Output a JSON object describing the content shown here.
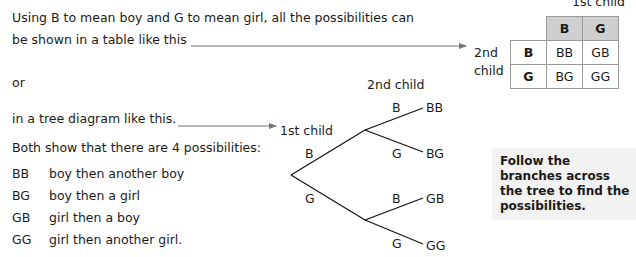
{
  "intro": {
    "line1": "Using B to mean boy and G to mean girl, all the possibilities can",
    "line2": "be shown in a table like this",
    "or": "or",
    "tree_intro": "in a tree diagram like this.",
    "summary": "Both show that there are 4 possibilities:"
  },
  "possibilities": [
    {
      "code": "BB",
      "meaning": "boy then another boy"
    },
    {
      "code": "BG",
      "meaning": "boy then a girl"
    },
    {
      "code": "GB",
      "meaning": "girl then a boy"
    },
    {
      "code": "GG",
      "meaning": "girl then another girl."
    }
  ],
  "table": {
    "col_axis_label": "1st child",
    "row_axis_label": "2nd child",
    "col_headers": [
      "B",
      "G"
    ],
    "rows": [
      {
        "header": "B",
        "cells": [
          "BB",
          "GB"
        ]
      },
      {
        "header": "G",
        "cells": [
          "BG",
          "GG"
        ]
      }
    ],
    "header_fill": "#cfcfcf"
  },
  "tree": {
    "first_level_label": "1st child",
    "second_level_label": "2nd child",
    "first_branches": [
      "B",
      "G"
    ],
    "second_branches": {
      "B": [
        {
          "label": "B",
          "outcome": "BB"
        },
        {
          "label": "G",
          "outcome": "BG"
        }
      ],
      "G": [
        {
          "label": "B",
          "outcome": "GB"
        },
        {
          "label": "G",
          "outcome": "GG"
        }
      ]
    }
  },
  "callout": {
    "text": "Follow the branches across the tree to find the possibilities."
  }
}
